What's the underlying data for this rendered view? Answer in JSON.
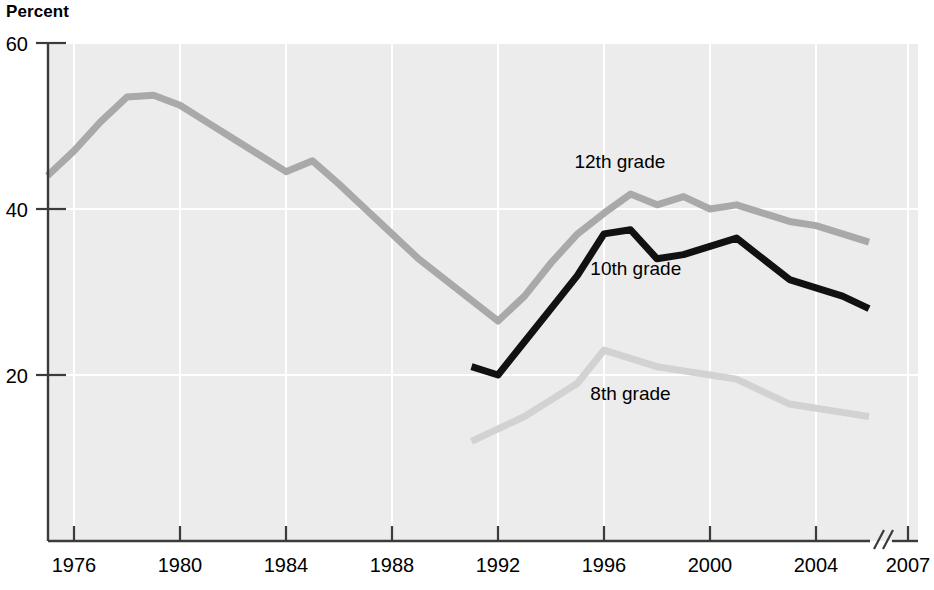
{
  "chart_data": {
    "type": "line",
    "title": "Percent",
    "ylabel": "Percent",
    "xlabel": "",
    "grid": "vertical white gridlines at each x tick and horizontal at y ticks",
    "legend": "inline series labels placed next to each line",
    "ylim": [
      0,
      60
    ],
    "yticks": [
      20,
      40,
      60
    ],
    "ytick_labels": [
      "20",
      "40",
      "60"
    ],
    "xlim": [
      1975,
      2007
    ],
    "xticks": [
      1976,
      1980,
      1984,
      1988,
      1992,
      1996,
      2000,
      2004,
      2007
    ],
    "xtick_labels": [
      "1976",
      "1980",
      "1984",
      "1988",
      "1992",
      "1996",
      "2000",
      "2004",
      "2007"
    ],
    "axis_break_before": "2007",
    "series": [
      {
        "name": "12th grade",
        "color": "#a9a9a9",
        "label_x": 1996.6,
        "label_y": 45.0,
        "x": [
          1975,
          1976,
          1977,
          1978,
          1979,
          1980,
          1981,
          1982,
          1983,
          1984,
          1985,
          1986,
          1987,
          1988,
          1989,
          1990,
          1991,
          1992,
          1993,
          1994,
          1995,
          1996,
          1997,
          1998,
          1999,
          2000,
          2001,
          2002,
          2003,
          2004,
          2005,
          2006
        ],
        "values": [
          44.0,
          47.0,
          50.5,
          53.5,
          53.7,
          52.5,
          50.5,
          48.5,
          46.5,
          44.5,
          45.8,
          43.0,
          40.0,
          37.0,
          34.0,
          31.5,
          29.0,
          26.5,
          29.5,
          33.5,
          37.0,
          39.5,
          41.8,
          40.5,
          41.5,
          40.0,
          40.5,
          39.5,
          38.5,
          38.0,
          37.0,
          36.0
        ]
      },
      {
        "name": "10th grade",
        "color": "#111111",
        "label_x": 1997.2,
        "label_y": 32.0,
        "x": [
          1991,
          1992,
          1993,
          1994,
          1995,
          1996,
          1997,
          1998,
          1999,
          2000,
          2001,
          2002,
          2003,
          2004,
          2005,
          2006
        ],
        "values": [
          21.0,
          20.0,
          24.0,
          28.0,
          32.0,
          37.0,
          37.5,
          34.0,
          34.5,
          35.5,
          36.5,
          34.0,
          31.5,
          30.5,
          29.5,
          28.0
        ]
      },
      {
        "name": "8th grade",
        "color": "#d2d2d2",
        "label_x": 1997.0,
        "label_y": 17.0,
        "x": [
          1991,
          1992,
          1993,
          1994,
          1995,
          1996,
          1997,
          1998,
          1999,
          2000,
          2001,
          2002,
          2003,
          2004,
          2005,
          2006
        ],
        "values": [
          12.0,
          13.5,
          15.0,
          17.0,
          19.0,
          23.0,
          22.0,
          21.0,
          20.5,
          20.0,
          19.5,
          18.0,
          16.5,
          16.0,
          15.5,
          15.0
        ]
      }
    ]
  }
}
